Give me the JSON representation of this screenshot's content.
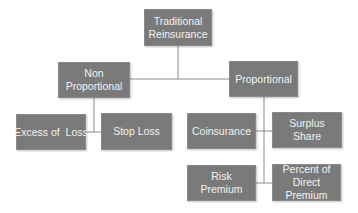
{
  "diagram": {
    "type": "hierarchy",
    "root": {
      "label": "Traditional Reinsurance",
      "label_lines": [
        "Traditional",
        "Reinsurance"
      ]
    },
    "level1": [
      {
        "label": "Non Proportional",
        "label_lines": [
          "Non",
          "Proportional"
        ]
      },
      {
        "label": "Proportional",
        "label_lines": [
          "Proportional"
        ]
      }
    ],
    "non_proportional_children": [
      {
        "label": "Excess of  Loss"
      },
      {
        "label": "Stop Loss"
      }
    ],
    "proportional_children": [
      {
        "label": "Coinsurance"
      },
      {
        "label": "Surplus Share"
      },
      {
        "label": "Risk Premium"
      },
      {
        "label": "Percent of Direct Premium",
        "label_lines": [
          "Percent of",
          "Direct Premium"
        ]
      }
    ],
    "colors": {
      "box_fill": "#7a7a7a",
      "box_text": "#f2f2f2",
      "connector": "#8c8c8c",
      "background": "#ffffff"
    }
  }
}
